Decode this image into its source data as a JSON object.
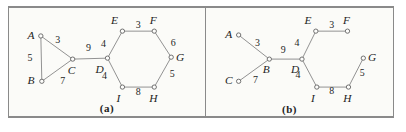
{
  "figure": {
    "colors": {
      "background": "#fbfbf8",
      "border": "#8a8a8a",
      "divider": "#8a8a8a",
      "edge": "#8f8f8f",
      "node_stroke": "#6e6e6e",
      "node_fill": "#fdfdfb",
      "text": "#1e1e1e"
    },
    "panels": [
      {
        "id": "a",
        "caption": "(a)",
        "width": 197,
        "height": 112,
        "nodes": [
          {
            "id": "A",
            "x": 32,
            "y": 29,
            "lx": 22,
            "ly": 28
          },
          {
            "id": "B",
            "x": 33,
            "y": 76,
            "lx": 22,
            "ly": 75
          },
          {
            "id": "C",
            "x": 64,
            "y": 53,
            "lx": 63,
            "ly": 64
          },
          {
            "id": "D",
            "x": 99,
            "y": 52,
            "lx": 91,
            "ly": 63
          },
          {
            "id": "E",
            "x": 114,
            "y": 24,
            "lx": 106,
            "ly": 13
          },
          {
            "id": "F",
            "x": 146,
            "y": 24,
            "lx": 145,
            "ly": 12
          },
          {
            "id": "G",
            "x": 163,
            "y": 51,
            "lx": 172,
            "ly": 51
          },
          {
            "id": "H",
            "x": 146,
            "y": 82,
            "lx": 145,
            "ly": 93
          },
          {
            "id": "I",
            "x": 114,
            "y": 82,
            "lx": 110,
            "ly": 93
          }
        ],
        "edges": [
          {
            "from": "A",
            "to": "B",
            "weight": "5",
            "wx": 21,
            "wy": 51
          },
          {
            "from": "A",
            "to": "C",
            "weight": "3",
            "wx": 49,
            "wy": 33
          },
          {
            "from": "B",
            "to": "C",
            "weight": "7",
            "wx": 54,
            "wy": 75
          },
          {
            "from": "C",
            "to": "D",
            "weight": "9",
            "wx": 80,
            "wy": 41
          },
          {
            "from": "D",
            "to": "E",
            "weight": "4",
            "wx": 95,
            "wy": 37
          },
          {
            "from": "E",
            "to": "F",
            "weight": "3",
            "wx": 130,
            "wy": 17
          },
          {
            "from": "F",
            "to": "G",
            "weight": "6",
            "wx": 165,
            "wy": 36
          },
          {
            "from": "G",
            "to": "H",
            "weight": "5",
            "wx": 164,
            "wy": 68
          },
          {
            "from": "H",
            "to": "I",
            "weight": "8",
            "wx": 130,
            "wy": 87
          },
          {
            "from": "I",
            "to": "D",
            "weight": "4",
            "wx": 96,
            "wy": 70
          }
        ]
      },
      {
        "id": "b",
        "caption": "(b)",
        "width": 189,
        "height": 112,
        "nodes": [
          {
            "id": "A",
            "x": 33,
            "y": 28,
            "lx": 23,
            "ly": 27
          },
          {
            "id": "B",
            "x": 64,
            "y": 53,
            "lx": 61,
            "ly": 63
          },
          {
            "id": "C",
            "x": 33,
            "y": 76,
            "lx": 23,
            "ly": 75
          },
          {
            "id": "D",
            "x": 97,
            "y": 53,
            "lx": 90,
            "ly": 63
          },
          {
            "id": "E",
            "x": 111,
            "y": 24,
            "lx": 103,
            "ly": 13
          },
          {
            "id": "F",
            "x": 143,
            "y": 24,
            "lx": 142,
            "ly": 12
          },
          {
            "id": "G",
            "x": 159,
            "y": 52,
            "lx": 168,
            "ly": 51
          },
          {
            "id": "H",
            "x": 144,
            "y": 82,
            "lx": 143,
            "ly": 93
          },
          {
            "id": "I",
            "x": 112,
            "y": 82,
            "lx": 108,
            "ly": 93
          }
        ],
        "edges": [
          {
            "from": "A",
            "to": "B",
            "weight": "3",
            "wx": 52,
            "wy": 36
          },
          {
            "from": "C",
            "to": "B",
            "weight": "7",
            "wx": 50,
            "wy": 74
          },
          {
            "from": "B",
            "to": "D",
            "weight": "9",
            "wx": 78,
            "wy": 43
          },
          {
            "from": "D",
            "to": "E",
            "weight": "4",
            "wx": 92,
            "wy": 36
          },
          {
            "from": "E",
            "to": "F",
            "weight": "3",
            "wx": 127,
            "wy": 17
          },
          {
            "from": "D",
            "to": "I",
            "weight": "4",
            "wx": 93,
            "wy": 69
          },
          {
            "from": "I",
            "to": "H",
            "weight": "8",
            "wx": 127,
            "wy": 86
          },
          {
            "from": "H",
            "to": "G",
            "weight": "5",
            "wx": 158,
            "wy": 67
          }
        ]
      }
    ]
  }
}
